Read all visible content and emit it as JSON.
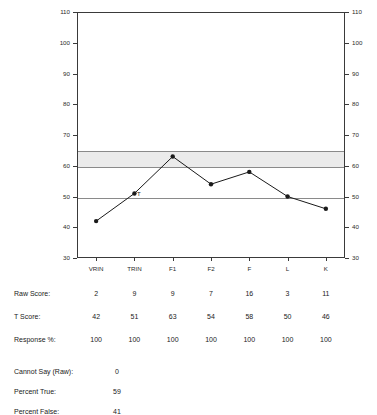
{
  "chart_data": {
    "type": "line",
    "title": "",
    "xlabel": "",
    "ylabel": "",
    "categories": [
      "VRIN",
      "TRIN",
      "F1",
      "F2",
      "F",
      "L",
      "K"
    ],
    "series": [
      {
        "name": "T Score",
        "values": [
          42,
          51,
          63,
          54,
          58,
          50,
          46
        ]
      }
    ],
    "ylim": [
      30,
      110
    ],
    "yticks": [
      30,
      40,
      50,
      60,
      70,
      80,
      90,
      100,
      110
    ],
    "ytick_labels": [
      "30",
      "40",
      "50",
      "60",
      "70",
      "80",
      "90",
      "100",
      "110"
    ],
    "right_axis": true,
    "right_ytick_labels": [
      "30",
      "40",
      "50",
      "60",
      "70",
      "80",
      "90",
      "100",
      "110"
    ],
    "grid": false,
    "reference_lines": [
      65,
      60,
      50
    ],
    "shaded_band": {
      "from": 60,
      "to": 65,
      "color": "#ebebeb"
    },
    "legend": "none",
    "annotations": [
      {
        "text": "T",
        "category": "TRIN",
        "value": 51
      }
    ],
    "marker": "filled-circle",
    "line_color": "#1a1a1a"
  },
  "table": {
    "columns": [
      "VRIN",
      "TRIN",
      "F1",
      "F2",
      "F",
      "L",
      "K"
    ],
    "rows": [
      {
        "label": "Raw Score:",
        "values": [
          "2",
          "9",
          "9",
          "7",
          "16",
          "3",
          "11"
        ]
      },
      {
        "label": "T Score:",
        "values": [
          "42",
          "51",
          "63",
          "54",
          "58",
          "50",
          "46"
        ]
      },
      {
        "label": "Response %:",
        "values": [
          "100",
          "100",
          "100",
          "100",
          "100",
          "100",
          "100"
        ]
      }
    ]
  },
  "summary": {
    "items": [
      {
        "label": "Cannot Say (Raw):",
        "value": "0"
      },
      {
        "label": "Percent True:",
        "value": "59"
      },
      {
        "label": "Percent False:",
        "value": "41"
      }
    ]
  },
  "colors": {
    "axis": "#3a3a3a",
    "reference_line": "#8a8a8a",
    "band": "#ebebeb",
    "text": "#1a1a1a",
    "series": "#1a1a1a"
  }
}
